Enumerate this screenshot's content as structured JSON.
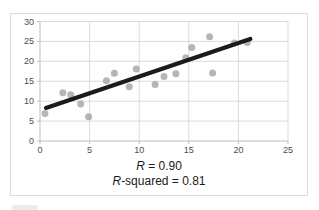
{
  "caption": {
    "line1_italic": "R",
    "line1_text": " = 0.90",
    "line2_italic": "R",
    "line2_text": "-squared = 0.81"
  },
  "chart_data": {
    "type": "scatter",
    "title": "",
    "xlabel": "",
    "ylabel": "",
    "xlim": [
      0,
      25
    ],
    "ylim": [
      0,
      30
    ],
    "x_ticks": [
      0,
      5,
      10,
      15,
      20,
      25
    ],
    "y_ticks": [
      0,
      5,
      10,
      15,
      20,
      25,
      30
    ],
    "grid": true,
    "legend": false,
    "points": [
      [
        0.5,
        6.9
      ],
      [
        2.3,
        12.1
      ],
      [
        3.1,
        11.6
      ],
      [
        4.1,
        9.3
      ],
      [
        4.9,
        6.1
      ],
      [
        6.7,
        15.1
      ],
      [
        7.5,
        17.0
      ],
      [
        9.0,
        13.6
      ],
      [
        9.7,
        18.1
      ],
      [
        11.6,
        14.2
      ],
      [
        12.5,
        16.2
      ],
      [
        13.7,
        16.9
      ],
      [
        14.7,
        20.9
      ],
      [
        15.3,
        23.5
      ],
      [
        17.1,
        26.2
      ],
      [
        17.4,
        17.1
      ],
      [
        19.6,
        24.6
      ],
      [
        20.9,
        24.7
      ]
    ],
    "trendline": {
      "x1": 0.6,
      "y1": 8.3,
      "x2": 21.2,
      "y2": 25.6
    },
    "annotations": [
      "R = 0.90",
      "R-squared = 0.81"
    ],
    "point_color": "#8f8f8f",
    "point_opacity": 0.65,
    "trendline_color": "#1b1b1b",
    "grid_color": "#dbdbdb",
    "axis_color": "#bdbdbd",
    "tick_label_color": "#4d4d4d"
  }
}
